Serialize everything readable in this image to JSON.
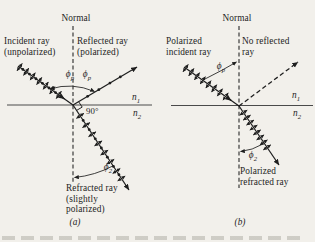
{
  "background": "#f2f0eb",
  "ink": "#1e1e1e",
  "panel_a": {
    "normal_label": "Normal",
    "incident_line1": "Incident ray",
    "incident_line2": "(unpolarized)",
    "reflected_line1": "Reflected ray",
    "reflected_line2": "(polarized)",
    "phi_incident": {
      "base": "ϕ",
      "sub": "p"
    },
    "phi_reflected": {
      "base": "ϕ",
      "sub": "p"
    },
    "right_angle_label": "90°",
    "n_upper": {
      "base": "n",
      "sub": "1"
    },
    "n_lower": {
      "base": "n",
      "sub": "2"
    },
    "phi_refracted": {
      "base": "ϕ",
      "sub": "2"
    },
    "refracted_line1": "Refracted ray",
    "refracted_line2": "(slightly",
    "refracted_line3": "polarized)",
    "caption": "(a)"
  },
  "panel_b": {
    "normal_label": "Normal",
    "incident_line1": "Polarized",
    "incident_line2": "incident ray",
    "no_reflected_line1": "No reflected",
    "no_reflected_line2": "ray",
    "phi_incident": {
      "base": "ϕ",
      "sub": "p"
    },
    "n_upper": {
      "base": "n",
      "sub": "1"
    },
    "n_lower": {
      "base": "n",
      "sub": "2"
    },
    "phi_refracted": {
      "base": "ϕ",
      "sub": "2"
    },
    "refracted_line1": "Polarized",
    "refracted_line2": "refracted ray",
    "caption": "(b)"
  }
}
